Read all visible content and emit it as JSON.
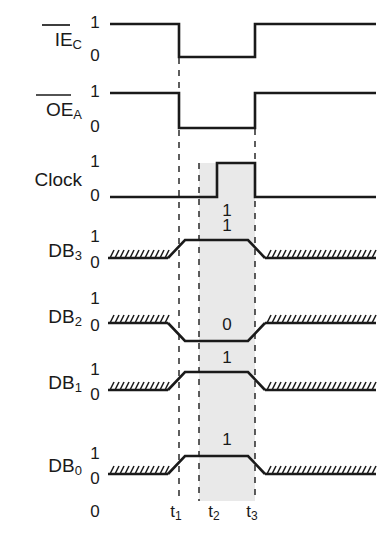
{
  "diagram": {
    "type": "digital-timing",
    "background_color": "#ffffff",
    "line_color": "#1a1a1a",
    "highlight_band_color": "#e9e9e9",
    "level_labels": {
      "high": "1",
      "low": "0"
    },
    "time_axis": {
      "origin_label": "0",
      "ticks": [
        {
          "name": "t1",
          "base": "t",
          "sub": "1",
          "x": 179
        },
        {
          "name": "t2",
          "base": "t",
          "sub": "2",
          "x": 217
        },
        {
          "name": "t3",
          "base": "t",
          "sub": "3",
          "x": 255
        }
      ]
    },
    "highlight_band": {
      "from": "t2",
      "to": "t3"
    },
    "signals": [
      {
        "id": "iec",
        "base": "IE",
        "sub": "C",
        "overline": true,
        "label_plain": "IE_C",
        "style": "square",
        "idle_state": "1",
        "transitions": [
          {
            "at": "t1",
            "to": "0"
          },
          {
            "at": "t3",
            "to": "1"
          }
        ],
        "value_label": null
      },
      {
        "id": "oea",
        "base": "OE",
        "sub": "A",
        "overline": true,
        "label_plain": "OE_A",
        "style": "square",
        "idle_state": "1",
        "transitions": [
          {
            "at": "t1",
            "to": "0"
          },
          {
            "at": "t3",
            "to": "1"
          }
        ],
        "value_label": null
      },
      {
        "id": "clock",
        "base": "Clock",
        "sub": "",
        "overline": false,
        "label_plain": "Clock",
        "style": "square",
        "idle_state": "0",
        "transitions": [
          {
            "at": "t2",
            "to": "1"
          },
          {
            "at": "t3",
            "to": "0"
          }
        ],
        "value_label": "1"
      },
      {
        "id": "db3",
        "base": "DB",
        "sub": "3",
        "overline": false,
        "label_plain": "DB_3",
        "style": "data",
        "idle_state": "hatched-low",
        "active_state": "1",
        "value_label": "1"
      },
      {
        "id": "db2",
        "base": "DB",
        "sub": "2",
        "overline": false,
        "label_plain": "DB_2",
        "style": "data",
        "idle_state": "hatched-high",
        "active_state": "0",
        "value_label": "0"
      },
      {
        "id": "db1",
        "base": "DB",
        "sub": "1",
        "overline": false,
        "label_plain": "DB_1",
        "style": "data",
        "idle_state": "hatched-low",
        "active_state": "1",
        "value_label": "1"
      },
      {
        "id": "db0",
        "base": "DB",
        "sub": "0",
        "overline": false,
        "label_plain": "DB_0",
        "style": "data",
        "idle_state": "hatched-low",
        "active_state": "1",
        "value_label": "1"
      }
    ],
    "data_word": {
      "db3": "1",
      "db2": "0",
      "db1": "1",
      "db0": "1"
    }
  }
}
